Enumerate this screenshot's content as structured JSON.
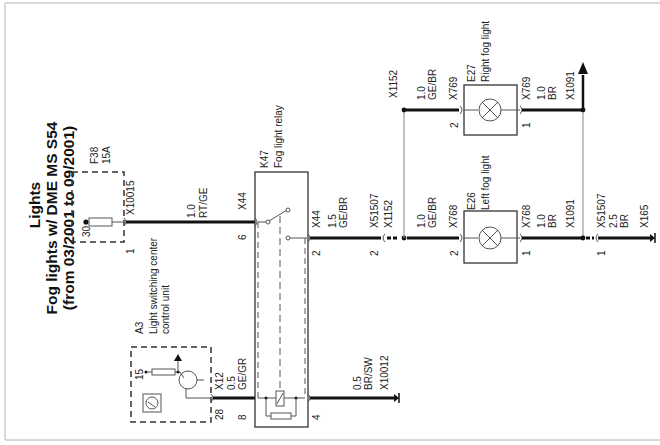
{
  "title": {
    "line1": "Lights",
    "line2": "Fog lights w/ DME MS S54",
    "line3": "(from 03/2001 to 09/2001)"
  },
  "components": {
    "fuse": {
      "id": "F38",
      "rating": "15A",
      "pin_in": "30",
      "pin_out": "1",
      "connector": "X10015"
    },
    "control_unit": {
      "id": "A3",
      "name_line1": "Light switching center",
      "name_line2": "control unit",
      "pin_15": "15",
      "pin_out": "28",
      "connector": "X12"
    },
    "relay": {
      "id": "K47",
      "name": "Fog light relay",
      "pin_in": "6",
      "pin_out": "2",
      "pin_coil": "8",
      "pin_ground": "4",
      "connector_in": "X44",
      "connector_out": "X44"
    },
    "left_light": {
      "id": "E26",
      "name": "Left fog light",
      "pin_in": "2",
      "pin_out": "1",
      "connector": "X768"
    },
    "right_light": {
      "id": "E27",
      "name": "Right fog light",
      "pin_in": "2",
      "pin_out": "1",
      "connector": "X769"
    }
  },
  "wires": {
    "fuse_to_relay": {
      "gauge": "1.0",
      "color": "RT/GE"
    },
    "a3_to_relay": {
      "gauge": "0.5",
      "color": "GE/GR"
    },
    "relay_ground": {
      "gauge": "0.5",
      "color": "BR/SW",
      "ground": "X10012"
    },
    "relay_to_splice": {
      "gauge": "1.5",
      "color": "GE/BR",
      "connector": "X51507",
      "pin": "2",
      "splice": "X1152"
    },
    "to_left_light": {
      "gauge": "1.0",
      "color": "GE/BR"
    },
    "to_right_light": {
      "gauge": "1.0",
      "color": "GE/BR",
      "splice": "X1152"
    },
    "left_light_ground": {
      "gauge": "1.0",
      "color": "BR",
      "splice": "X1091"
    },
    "right_light_ground": {
      "gauge": "1.0",
      "color": "BR",
      "splice": "X1091"
    },
    "final_ground": {
      "gauge": "2.5",
      "color": "BR",
      "connector": "X51507",
      "pin": "1",
      "ground": "X165"
    }
  }
}
